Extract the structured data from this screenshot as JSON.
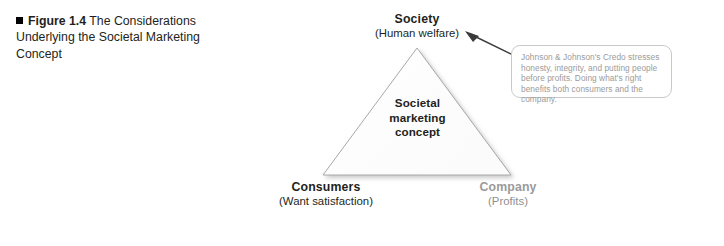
{
  "figure": {
    "bullet_icon": "black-square-bullet",
    "number_label": "Figure 1.4",
    "title_rest": "The Considerations Underlying the Societal Marketing Concept"
  },
  "diagram": {
    "type": "triangle",
    "center_lines": [
      "Societal",
      "marketing",
      "concept"
    ],
    "shape_fill": "#ffffff",
    "shape_stroke": "#a8a8a8",
    "vertices": [
      {
        "id": "society",
        "position": "top",
        "title": "Society",
        "subtitle": "(Human welfare)",
        "title_color": "#231f20"
      },
      {
        "id": "consumers",
        "position": "bottom-left",
        "title": "Consumers",
        "subtitle": "(Want satisfaction)",
        "title_color": "#231f20"
      },
      {
        "id": "company",
        "position": "bottom-right",
        "title": "Company",
        "subtitle": "(Profits)",
        "title_color": "#9a9a9a"
      }
    ]
  },
  "callout": {
    "arrow_icon": "arrow-up-left",
    "arrow_points_to": "society",
    "border_color": "#c9c9c9",
    "text_color": "#9b9b9b",
    "text": "Johnson & Johnson's Credo stresses honesty, integrity, and putting people before profits.  Doing what's right benefits both consumers and the company."
  }
}
